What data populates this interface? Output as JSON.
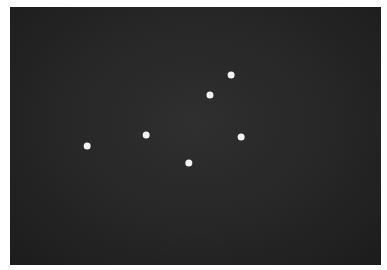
{
  "image": {
    "description": "Photograph of six white dots on a dark background",
    "background_color": "#262626",
    "dot_color": "#f2f2f2",
    "dots": [
      {
        "id": 1,
        "x": 0.596,
        "y": 0.264
      },
      {
        "id": 2,
        "x": 0.539,
        "y": 0.341
      },
      {
        "id": 3,
        "x": 0.367,
        "y": 0.496
      },
      {
        "id": 4,
        "x": 0.623,
        "y": 0.504
      },
      {
        "id": 5,
        "x": 0.208,
        "y": 0.539
      },
      {
        "id": 6,
        "x": 0.482,
        "y": 0.605
      }
    ]
  }
}
